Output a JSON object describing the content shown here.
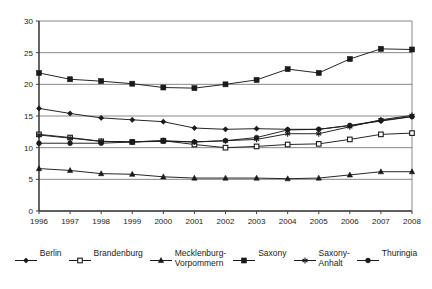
{
  "chart_data": {
    "type": "line",
    "title": "",
    "xlabel": "",
    "ylabel": "",
    "categories": [
      "1996",
      "1997",
      "1998",
      "1999",
      "2000",
      "2001",
      "2002",
      "2003",
      "2004",
      "2005",
      "2006",
      "2007",
      "2008"
    ],
    "ylim": [
      0,
      30
    ],
    "yticks": [
      0,
      5,
      10,
      15,
      20,
      25,
      30
    ],
    "grid": "horizontal",
    "legend_position": "bottom",
    "series": [
      {
        "name": "Berlin",
        "marker": "diamond",
        "color": "#1a1a1a",
        "values": [
          16.2,
          15.4,
          14.7,
          14.4,
          14.1,
          13.1,
          12.9,
          13.0,
          12.9,
          12.9,
          13.5,
          14.2,
          14.9
        ]
      },
      {
        "name": "Brandenburg",
        "marker": "open-square",
        "color": "#1a1a1a",
        "values": [
          12.1,
          11.6,
          11.0,
          10.9,
          11.1,
          10.5,
          10.0,
          10.2,
          10.5,
          10.6,
          11.3,
          12.1,
          12.3
        ]
      },
      {
        "name": "Mecklenburg-\nVorpommern",
        "marker": "triangle",
        "color": "#1a1a1a",
        "values": [
          6.7,
          6.4,
          5.9,
          5.8,
          5.4,
          5.2,
          5.2,
          5.2,
          5.1,
          5.2,
          5.7,
          6.2,
          6.2
        ]
      },
      {
        "name": "Saxony",
        "marker": "filled-square",
        "color": "#1a1a1a",
        "values": [
          21.8,
          20.8,
          20.5,
          20.1,
          19.5,
          19.4,
          20.0,
          20.7,
          22.4,
          21.8,
          24.0,
          25.6,
          25.5
        ]
      },
      {
        "name": "Saxony-\nAnhalt",
        "marker": "asterisk",
        "color": "#1a1a1a",
        "values": [
          12.0,
          11.5,
          11.0,
          10.9,
          11.1,
          10.9,
          11.1,
          11.3,
          12.2,
          12.2,
          13.3,
          14.4,
          15.1
        ]
      },
      {
        "name": "Thuringia",
        "marker": "filled-circle",
        "color": "#1a1a1a",
        "values": [
          10.7,
          10.7,
          10.7,
          10.9,
          11.0,
          10.9,
          11.1,
          11.6,
          12.8,
          12.9,
          13.5,
          14.3,
          14.9
        ]
      }
    ]
  },
  "legend": {
    "items": [
      {
        "label": "Berlin",
        "marker": "diamond"
      },
      {
        "label": "Brandenburg",
        "marker": "open-square"
      },
      {
        "label": "Mecklenburg-\nVorpommern",
        "marker": "triangle"
      },
      {
        "label": "Saxony",
        "marker": "filled-square"
      },
      {
        "label": "Saxony-\nAnhalt",
        "marker": "asterisk"
      },
      {
        "label": "Thuringia",
        "marker": "filled-circle"
      }
    ]
  },
  "colors": {
    "axis": "#3f3f3f",
    "grid": "#7a7a7a",
    "series": "#1a1a1a",
    "background": "#ffffff"
  }
}
